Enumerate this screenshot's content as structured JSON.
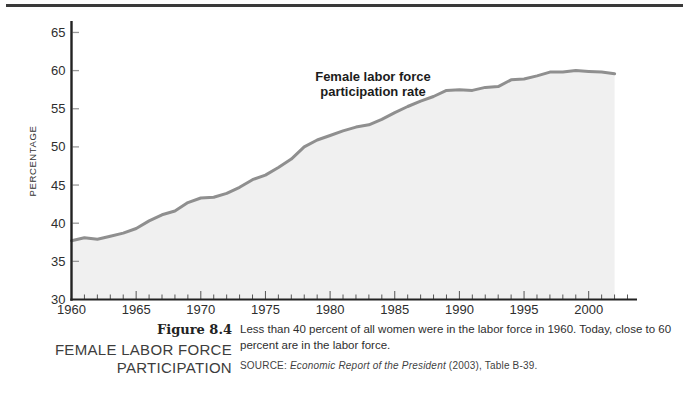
{
  "figure": {
    "number_label": "Figure 8.4",
    "title_lines": [
      "FEMALE LABOR FORCE",
      "PARTICIPATION"
    ],
    "description": "Less than 40 percent of all women were in the labor force in 1960. Today, close to 60 percent are in the labor force.",
    "source_prefix": "SOURCE: ",
    "source_title": "Economic Report of the President",
    "source_suffix": " (2003), Table B-39."
  },
  "chart_data": {
    "type": "area",
    "title": "",
    "annotation": "Female labor force participation rate",
    "annotation_lines": [
      "Female labor force",
      "participation rate"
    ],
    "xlabel": "",
    "ylabel": "PERCENTAGE",
    "xlim": [
      1960,
      2003
    ],
    "ylim": [
      30,
      65
    ],
    "y_ticks": [
      30,
      35,
      40,
      45,
      50,
      55,
      60,
      65
    ],
    "x_major_ticks": [
      1960,
      1965,
      1970,
      1975,
      1980,
      1985,
      1990,
      1995,
      2000
    ],
    "grid": false,
    "legend": false,
    "x": [
      1960,
      1961,
      1962,
      1963,
      1964,
      1965,
      1966,
      1967,
      1968,
      1969,
      1970,
      1971,
      1972,
      1973,
      1974,
      1975,
      1976,
      1977,
      1978,
      1979,
      1980,
      1981,
      1982,
      1983,
      1984,
      1985,
      1986,
      1987,
      1988,
      1989,
      1990,
      1991,
      1992,
      1993,
      1994,
      1995,
      1996,
      1997,
      1998,
      1999,
      2000,
      2001,
      2002
    ],
    "values": [
      37.7,
      38.1,
      37.9,
      38.3,
      38.7,
      39.3,
      40.3,
      41.1,
      41.6,
      42.7,
      43.3,
      43.4,
      43.9,
      44.7,
      45.7,
      46.3,
      47.3,
      48.4,
      50.0,
      50.9,
      51.5,
      52.1,
      52.6,
      52.9,
      53.6,
      54.5,
      55.3,
      56.0,
      56.6,
      57.4,
      57.5,
      57.4,
      57.8,
      57.9,
      58.8,
      58.9,
      59.3,
      59.8,
      59.8,
      60.0,
      59.9,
      59.8,
      59.6
    ],
    "line_color": "#8f8f8f",
    "fill_color": "#f0f0f0",
    "axis_color": "#222222",
    "tick_color": "#555555",
    "y_tick_color": "#999999",
    "label_color": "#2e2e2e"
  }
}
